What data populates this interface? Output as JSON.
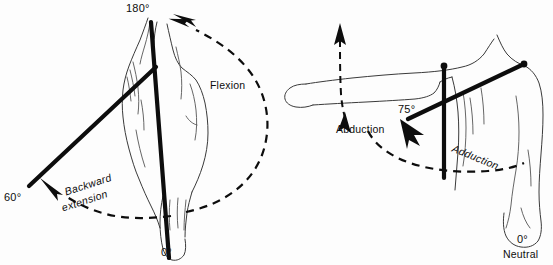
{
  "figure": {
    "background_color": "#fdfdfd",
    "ink_color": "#0d0d0d"
  },
  "panels": [
    {
      "id": "sagittal",
      "name": "flexion-extension-panel",
      "labels": {
        "top_angle": "180°",
        "bottom_angle": "0°",
        "back_angle": "60°",
        "motion_forward": "Flexion",
        "motion_backward_line1": "Backward",
        "motion_backward_line2": "extension"
      }
    },
    {
      "id": "frontal",
      "name": "abduction-adduction-panel",
      "labels": {
        "arm_angle": "75°",
        "neutral_angle": "0°",
        "neutral_caption": "Neutral",
        "motion_away": "Abduction",
        "motion_toward": "Adduction"
      }
    }
  ]
}
